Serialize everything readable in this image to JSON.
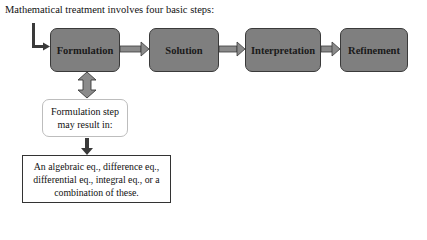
{
  "title": "Mathematical treatment involves four basic steps:",
  "steps": [
    {
      "label": "Formulation"
    },
    {
      "label": "Solution"
    },
    {
      "label": "Interpretation"
    },
    {
      "label": "Refinement"
    }
  ],
  "note_box": {
    "text": "Formulation step may result in:"
  },
  "result_box": {
    "text": "An algebraic eq., difference eq., differential eq., integral eq., or a combination of these."
  },
  "colors": {
    "step_fill": "#7f7f7f",
    "step_border": "#3a3a3a",
    "arrow_fill": "#8a8a8a",
    "arrow_dark": "#3a3a3a"
  }
}
